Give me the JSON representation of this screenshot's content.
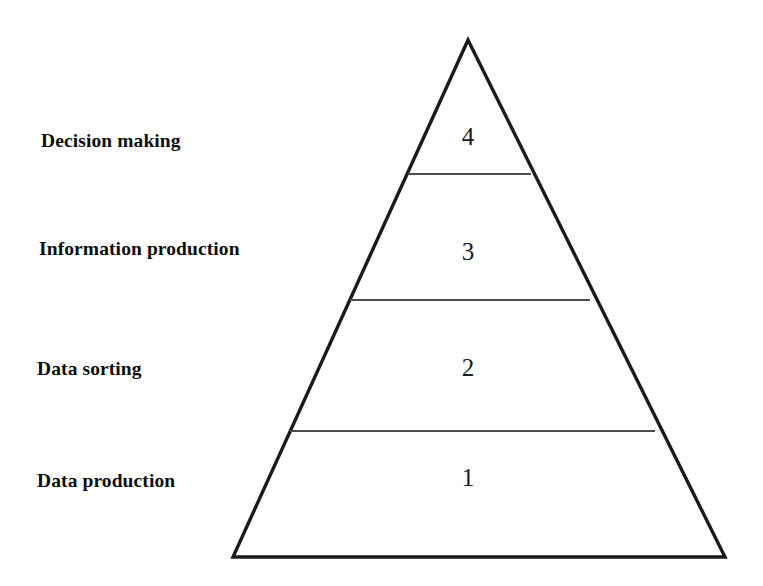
{
  "diagram": {
    "type": "pyramid",
    "title": "",
    "background_color": "#ffffff",
    "outline_color": "#1a1a1a",
    "divider_color": "#4d4d4d",
    "text_color": "#0d0d0d",
    "orientation": "apex-up",
    "tier_count": 4,
    "tiers": [
      {
        "number": "4",
        "label": "Decision making",
        "position": "top",
        "rank": 4
      },
      {
        "number": "3",
        "label": "Information production",
        "position": "upper-middle",
        "rank": 3
      },
      {
        "number": "2",
        "label": "Data sorting",
        "position": "lower-middle",
        "rank": 2
      },
      {
        "number": "1",
        "label": "Data production",
        "position": "bottom",
        "rank": 1
      }
    ],
    "geometry": {
      "apex": {
        "x": 468,
        "y": 40
      },
      "base_left": {
        "x": 233,
        "y": 557
      },
      "base_right": {
        "x": 725,
        "y": 557
      },
      "dividers": [
        {
          "y": 174,
          "x_left": 408,
          "x_right": 531
        },
        {
          "y": 300,
          "x_left": 350,
          "x_right": 590
        },
        {
          "y": 431,
          "x_left": 290,
          "x_right": 655
        }
      ]
    }
  }
}
